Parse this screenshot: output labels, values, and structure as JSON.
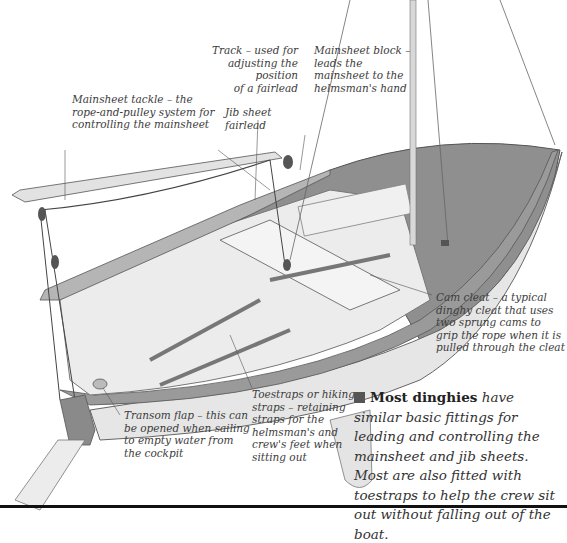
{
  "figure": {
    "labels": {
      "mainsheet_tackle": [
        "Mainsheet tackle – the",
        "rope-and-pulley system for",
        "controlling the mainsheet"
      ],
      "track": [
        "Track – used for",
        "adjusting the position",
        "of a fairlead"
      ],
      "mainsheet_block": [
        "Mainsheet block –",
        "leads the",
        "mainsheet to the",
        "helmsman's hand"
      ],
      "jib_sheet_fairlead": [
        "Jib sheet",
        "fairlead"
      ],
      "cam_cleat": [
        "Cam cleat – a typical",
        "dinghy cleat that uses",
        "two sprung cams to",
        "grip the rope when it is",
        "pulled through the cleat"
      ],
      "toestraps": [
        "Toestraps or hiking",
        "straps – retaining",
        "straps for the",
        "helmsman's and",
        "crew's feet when",
        "sitting out"
      ],
      "transom_flap": [
        "Transom flap – this can",
        "be opened when sailing",
        "to empty water from",
        "the cockpit"
      ]
    },
    "caption": {
      "bold_lead": "Most dinghies",
      "text": "have similar basic fittings for leading and controlling the mainsheet and jib sheets. Most are also fitted with toestraps to help the crew sit out without falling out of the boat."
    },
    "colors": {
      "hull_deck": "#8f8f8f",
      "hull_side": "#e8e8e8",
      "cockpit": "#dcdcdc",
      "outline": "#555555",
      "text": "#3c3c3c"
    }
  }
}
